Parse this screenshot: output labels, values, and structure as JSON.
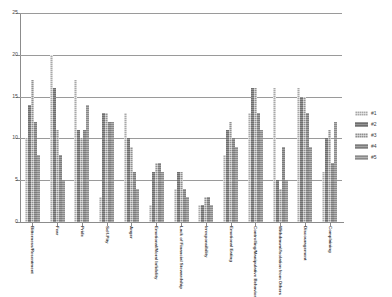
{
  "chart_data": {
    "type": "bar",
    "title": "",
    "subtitle": "",
    "xlabel": "",
    "ylabel": "",
    "ylim": [
      0,
      25
    ],
    "ytick_values": [
      0,
      5,
      10,
      15,
      20,
      25
    ],
    "ytick_labels": [
      "0",
      "5",
      "10",
      "15",
      "20",
      "25"
    ],
    "grid": true,
    "legend_position": "right",
    "categories": [
      "Bitterness/Resentment",
      "Fear",
      "Pride",
      "Self-Pity",
      "Anger",
      "Emotional/Moral Infidelity",
      "Lack of Financial Stewardship",
      "Irresponsibility",
      "Emotional Eating",
      "Controlling/Manipulative Behavior",
      "Withdrawal/Isolation from Others",
      "Discouragement",
      "Complaining"
    ],
    "series": [
      {
        "name": "#1",
        "values": [
          10,
          20,
          17,
          3,
          13,
          2,
          4,
          2,
          8,
          13,
          16,
          16,
          6
        ]
      },
      {
        "name": "#2",
        "values": [
          14,
          16,
          11,
          13,
          10,
          6,
          6,
          2,
          11,
          16,
          5,
          15,
          10
        ]
      },
      {
        "name": "#3",
        "values": [
          17,
          11,
          10,
          13,
          9,
          7,
          6,
          3,
          12,
          16,
          4,
          15,
          11
        ]
      },
      {
        "name": "#4",
        "values": [
          12,
          8,
          11,
          12,
          6,
          7,
          4,
          3,
          10,
          13,
          9,
          13,
          7
        ]
      },
      {
        "name": "#5",
        "values": [
          8,
          5,
          14,
          12,
          4,
          6,
          3,
          2,
          9,
          11,
          5,
          9,
          12
        ]
      }
    ]
  },
  "legend": {
    "entries": [
      {
        "label": "#1"
      },
      {
        "label": "#2"
      },
      {
        "label": "#3"
      },
      {
        "label": "#4"
      },
      {
        "label": "#5"
      }
    ]
  }
}
